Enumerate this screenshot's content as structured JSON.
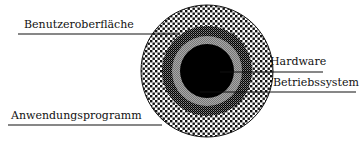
{
  "diagram": {
    "type": "concentric-layers",
    "layers": [
      {
        "name": "Hardware",
        "ring": "innermost black core"
      },
      {
        "name": "Betriebssystem",
        "ring": "gray ring"
      },
      {
        "name": "Benutzeroberfläche",
        "ring": "checkered ring"
      },
      {
        "name": "Anwendungsprogramm",
        "ring": "outer dotted ring"
      }
    ]
  },
  "labels": {
    "benutzeroberflaeche": "Benutzeroberfläche",
    "hardware": "Hardware",
    "betriebssystem": "Betriebssystem",
    "anwendungsprogramm": "Anwendungsprogramm"
  },
  "colors": {
    "core": "#000000",
    "gray_ring": "#9a9a9a",
    "line": "#111111",
    "background": "#ffffff"
  }
}
